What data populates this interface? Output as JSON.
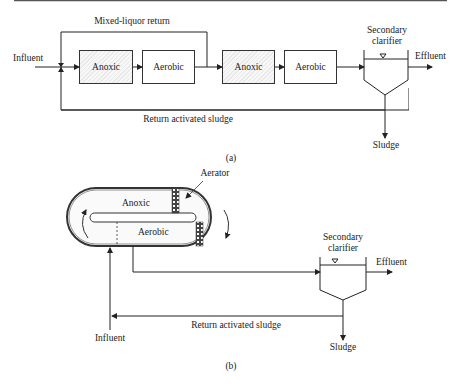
{
  "diagram_a": {
    "caption": "(a)",
    "labels": {
      "influent": "Influent",
      "mixed_liquor_return": "Mixed-liquor return",
      "return_sludge": "Return activated sludge",
      "sludge": "Sludge",
      "effluent": "Effluent",
      "clarifier": "Secondary clarifier",
      "clarifier_line1": "Secondary",
      "clarifier_line2": "clarifier"
    },
    "stages": [
      {
        "label": "Anoxic",
        "type": "anoxic"
      },
      {
        "label": "Aerobic",
        "type": "aerobic"
      },
      {
        "label": "Anoxic",
        "type": "anoxic"
      },
      {
        "label": "Aerobic",
        "type": "aerobic"
      }
    ]
  },
  "diagram_b": {
    "caption": "(b)",
    "labels": {
      "aerator": "Aerator",
      "anoxic": "Anoxic",
      "aerobic": "Aerobic",
      "influent": "Influent",
      "return_sludge": "Return activated sludge",
      "sludge": "Sludge",
      "effluent": "Effluent",
      "clarifier_line1": "Secondary",
      "clarifier_line2": "clarifier"
    }
  }
}
